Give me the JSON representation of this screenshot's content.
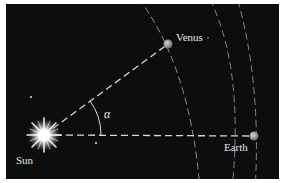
{
  "figure": {
    "background_color": "#0d0d0d",
    "line_color": "#d8d8d8",
    "labels": {
      "sun": "Sun",
      "venus": "Venus",
      "earth": "Earth",
      "angle": "α"
    },
    "bodies": [
      {
        "name": "Sun",
        "x": 44,
        "y": 135
      },
      {
        "name": "Venus",
        "x": 168,
        "y": 44
      },
      {
        "name": "Earth",
        "x": 254,
        "y": 136
      }
    ],
    "lines": [
      {
        "from": "Sun",
        "to": "Venus",
        "style": "dashed"
      },
      {
        "from": "Sun",
        "to": "Earth",
        "style": "dashed"
      }
    ],
    "angle": {
      "vertex": "Sun",
      "between": [
        "Venus",
        "Earth"
      ],
      "symbol": "α"
    }
  }
}
